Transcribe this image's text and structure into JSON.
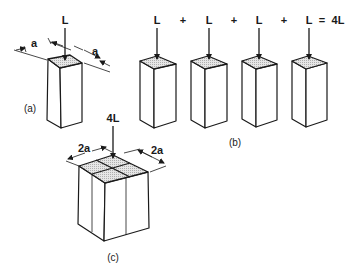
{
  "figure": {
    "panel_a": {
      "caption": "(a)",
      "load_label": "L",
      "dim_left": "a",
      "dim_right": "a"
    },
    "panel_b": {
      "caption": "(b)",
      "loads": [
        "L",
        "L",
        "L",
        "L"
      ],
      "operators": [
        "+",
        "+",
        "+"
      ],
      "equals": "=",
      "total": "4L"
    },
    "panel_c": {
      "caption": "(c)",
      "load_label": "4L",
      "dim_left": "2a",
      "dim_right": "2a"
    }
  },
  "colors": {
    "ink": "#1a1a1a",
    "top_face": "#d8d8d8",
    "background": "#ffffff"
  }
}
